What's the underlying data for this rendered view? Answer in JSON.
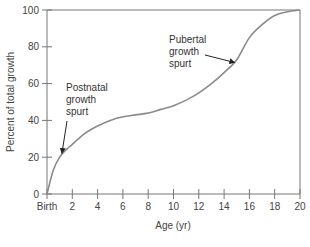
{
  "chart_data": {
    "type": "line",
    "title": "",
    "xlabel": "Age (yr)",
    "ylabel": "Percent of total growth",
    "xlim": [
      0,
      20
    ],
    "ylim": [
      0,
      100
    ],
    "grid": false,
    "x_ticks": [
      "Birth",
      "2",
      "4",
      "6",
      "8",
      "10",
      "12",
      "14",
      "16",
      "18",
      "20"
    ],
    "y_ticks": [
      "0",
      "20",
      "40",
      "60",
      "80",
      "100"
    ],
    "series": [
      {
        "name": "Growth curve",
        "color": "#8a8a8a",
        "x": [
          0,
          0.5,
          1,
          1.5,
          2,
          3,
          4,
          5,
          6,
          7,
          8,
          9,
          10,
          11,
          12,
          13,
          14,
          15,
          16,
          17,
          18,
          19,
          20
        ],
        "y": [
          0,
          13,
          20,
          24,
          27,
          33,
          37,
          40,
          42,
          43,
          44,
          46,
          48,
          51,
          55,
          60,
          66,
          73,
          85,
          92,
          97,
          99,
          100
        ]
      }
    ],
    "annotations": [
      {
        "text": [
          "Postnatal",
          "growth",
          "spurt"
        ],
        "points_to": {
          "x": 1.1,
          "y": 21
        }
      },
      {
        "text": [
          "Pubertal",
          "growth",
          "spurt"
        ],
        "points_to": {
          "x": 15,
          "y": 72
        }
      }
    ]
  }
}
